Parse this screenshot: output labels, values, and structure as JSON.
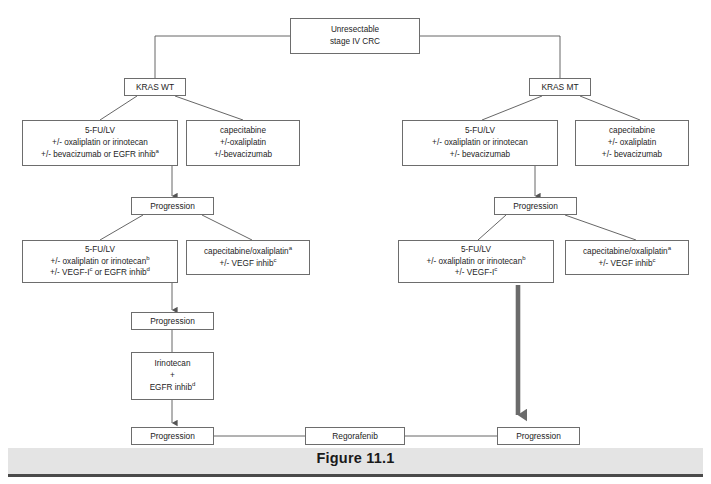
{
  "figure": {
    "caption": "Figure 11.1"
  },
  "nodes": {
    "root": {
      "line1": "Unresectable",
      "line2": "stage IV  CRC"
    },
    "kras_wt": {
      "label": "KRAS WT"
    },
    "kras_mt": {
      "label": "KRAS MT"
    },
    "wt_first_a": {
      "line1": "5-FU/LV",
      "line2": "+/- oxaliplatin or irinotecan",
      "line3": "+/- bevacizumab or EGFR inhib",
      "line3_sup": "a"
    },
    "wt_first_b": {
      "line1": "capecitabine",
      "line2": "+/-oxaliplatin",
      "line3": "+/-bevacizumab"
    },
    "mt_first_a": {
      "line1": "5-FU/LV",
      "line2": "+/- oxaliplatin or irinotecan",
      "line3": "+/- bevacizumab"
    },
    "mt_first_b": {
      "line1": "capecitabine",
      "line2": "+/- oxaliplatin",
      "line3": "+/- bevacizumab"
    },
    "prog_wt_1": {
      "label": "Progression"
    },
    "prog_mt_1": {
      "label": "Progression"
    },
    "wt_second_a": {
      "line1": "5-FU/LV",
      "line2": "+/- oxaliplatin or irinotecan",
      "line2_sup": "b",
      "line3": "+/- VEGF-I",
      "line3_sup": "c",
      "line3_tail": " or EGFR inhib",
      "line3_sup2": "d"
    },
    "wt_second_b": {
      "line1": "capecitabine/oxaliplatin",
      "line1_sup": "a",
      "line2": "+/- VEGF inhib",
      "line2_sup": "c"
    },
    "mt_second_a": {
      "line1": "5-FU/LV",
      "line2": "+/- oxaliplatin or irinotecan",
      "line2_sup": "b",
      "line3": "+/- VEGF-I",
      "line3_sup": "c"
    },
    "mt_second_b": {
      "line1": "capecitabine/oxaliplatin",
      "line1_sup": "a",
      "line2": "+/- VEGF inhib",
      "line2_sup": "c"
    },
    "prog_wt_2": {
      "label": "Progression"
    },
    "wt_third": {
      "line1": "Irinotecan",
      "line2": "+",
      "line3": "EGFR inhib",
      "line3_sup": "d"
    },
    "prog_wt_3": {
      "label": "Progression"
    },
    "regorafenib": {
      "label": "Regorafenib"
    },
    "prog_mt_2": {
      "label": "Progression"
    }
  },
  "colors": {
    "box_border": "#6d6d6d",
    "line": "#555555",
    "thick_arrow": "#6b6b6b",
    "caption_band": "#e4e4e4",
    "caption_rule": "#4a4a4a",
    "text": "#1d1d1d"
  }
}
